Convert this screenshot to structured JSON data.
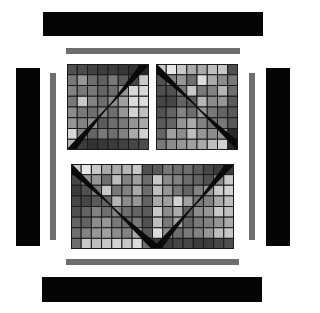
{
  "colors": {
    "background": "#ffffff",
    "black_bar": "#050505",
    "gray_bar": "#6e6e6e",
    "grid_line": "#1a1a1a",
    "wedge": "#0a0a0a"
  },
  "bars": [
    {
      "name": "top-black-bar",
      "x": 43,
      "y": 12,
      "w": 220,
      "h": 24,
      "kind": "black"
    },
    {
      "name": "top-gray-bar",
      "x": 66,
      "y": 48,
      "w": 174,
      "h": 6,
      "kind": "gray"
    },
    {
      "name": "left-black-bar",
      "x": 16,
      "y": 68,
      "w": 24,
      "h": 178,
      "kind": "black"
    },
    {
      "name": "left-gray-bar",
      "x": 50,
      "y": 73,
      "w": 6,
      "h": 167,
      "kind": "gray"
    },
    {
      "name": "right-gray-bar",
      "x": 249,
      "y": 73,
      "w": 6,
      "h": 167,
      "kind": "gray"
    },
    {
      "name": "right-black-bar",
      "x": 266,
      "y": 68,
      "w": 24,
      "h": 178,
      "kind": "black"
    },
    {
      "name": "bottom-gray-bar",
      "x": 66,
      "y": 259,
      "w": 173,
      "h": 6,
      "kind": "gray"
    },
    {
      "name": "bottom-black-bar",
      "x": 42,
      "y": 277,
      "w": 220,
      "h": 25,
      "kind": "black"
    }
  ],
  "panels": [
    {
      "name": "top-left-grid-panel",
      "x": 67,
      "y": 64,
      "w": 82,
      "h": 86,
      "cols": 8,
      "rows": 8,
      "diagonals": [
        {
          "from": [
            0,
            1
          ],
          "to": [
            1,
            0
          ]
        }
      ],
      "cells": [
        [
          80,
          75,
          65,
          60,
          60,
          55,
          50,
          40
        ],
        [
          120,
          150,
          110,
          95,
          120,
          90,
          70,
          200
        ],
        [
          130,
          120,
          120,
          100,
          110,
          150,
          215,
          215
        ],
        [
          120,
          200,
          130,
          110,
          140,
          160,
          220,
          220
        ],
        [
          140,
          120,
          110,
          130,
          110,
          150,
          210,
          190
        ],
        [
          150,
          130,
          140,
          90,
          110,
          120,
          150,
          170
        ],
        [
          215,
          130,
          100,
          120,
          110,
          130,
          170,
          210
        ],
        [
          180,
          60,
          50,
          55,
          60,
          65,
          70,
          75
        ]
      ]
    },
    {
      "name": "top-right-grid-panel",
      "x": 156,
      "y": 64,
      "w": 82,
      "h": 86,
      "cols": 8,
      "rows": 8,
      "diagonals": [
        {
          "from": [
            0,
            0
          ],
          "to": [
            1,
            1
          ]
        }
      ],
      "cells": [
        [
          200,
          230,
          200,
          170,
          170,
          190,
          200,
          80
        ],
        [
          80,
          130,
          150,
          110,
          220,
          170,
          140,
          120
        ],
        [
          80,
          80,
          120,
          200,
          120,
          130,
          180,
          110
        ],
        [
          70,
          70,
          100,
          90,
          180,
          140,
          150,
          90
        ],
        [
          80,
          100,
          130,
          110,
          150,
          120,
          100,
          90
        ],
        [
          90,
          100,
          150,
          170,
          130,
          110,
          120,
          90
        ],
        [
          100,
          160,
          140,
          190,
          150,
          140,
          150,
          40
        ],
        [
          120,
          140,
          150,
          160,
          170,
          190,
          210,
          40
        ]
      ]
    },
    {
      "name": "bottom-grid-panel",
      "x": 71,
      "y": 164,
      "w": 163,
      "h": 85,
      "cols": 16,
      "rows": 8,
      "diagonals": [
        {
          "from": [
            0,
            0
          ],
          "to": [
            0.5,
            1
          ]
        },
        {
          "from": [
            1,
            0
          ],
          "to": [
            0.5,
            1
          ]
        }
      ],
      "cells": [
        [
          200,
          230,
          200,
          170,
          170,
          180,
          200,
          80,
          90,
          120,
          110,
          110,
          90,
          70,
          60,
          60
        ],
        [
          70,
          150,
          150,
          110,
          190,
          130,
          160,
          110,
          200,
          140,
          130,
          110,
          100,
          80,
          140,
          200
        ],
        [
          60,
          80,
          120,
          200,
          120,
          130,
          170,
          110,
          190,
          150,
          120,
          100,
          130,
          150,
          200,
          210
        ],
        [
          70,
          70,
          90,
          100,
          180,
          140,
          150,
          100,
          170,
          160,
          210,
          160,
          120,
          130,
          170,
          190
        ],
        [
          80,
          100,
          130,
          110,
          130,
          110,
          100,
          90,
          200,
          140,
          170,
          100,
          140,
          150,
          200,
          190
        ],
        [
          100,
          100,
          140,
          150,
          120,
          110,
          120,
          80,
          190,
          120,
          160,
          100,
          120,
          130,
          150,
          170
        ],
        [
          110,
          130,
          150,
          160,
          140,
          130,
          170,
          90,
          220,
          140,
          110,
          120,
          130,
          150,
          190,
          200
        ],
        [
          110,
          200,
          190,
          200,
          210,
          200,
          220,
          110,
          60,
          60,
          70,
          70,
          60,
          60,
          70,
          80
        ]
      ]
    }
  ]
}
